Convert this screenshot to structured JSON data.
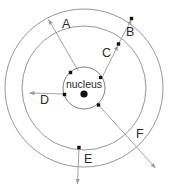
{
  "diagram": {
    "kind": "bohr-atomic-model",
    "background_color": "#ffffff",
    "orbit_stroke_color": "#8a8a8a",
    "arrow_stroke_color": "#9a9a9a",
    "electron_color": "#111111",
    "label_color": "#2b2b2b",
    "center": {
      "x": 84,
      "y": 88
    },
    "nucleus": {
      "label": "nucleus",
      "radius": 21,
      "core_dot_radius": 3.6
    },
    "orbits": [
      {
        "name": "nucleus-boundary",
        "radius": 21
      },
      {
        "name": "middle-shell",
        "radius": 62
      },
      {
        "name": "outer-shell",
        "radius": 79
      }
    ],
    "electrons": [
      {
        "name": "electron-nucleus-upper-left",
        "x": 70.5,
        "y": 72.5,
        "size": 3.4
      },
      {
        "name": "electron-nucleus-left",
        "x": 64.5,
        "y": 94.5,
        "size": 3.4
      },
      {
        "name": "electron-nucleus-upper-right",
        "x": 100.5,
        "y": 77.5,
        "size": 3.2
      },
      {
        "name": "electron-nucleus-lower-right",
        "x": 98.5,
        "y": 105.0,
        "size": 3.4
      },
      {
        "name": "electron-middle-upper-right",
        "x": 118.5,
        "y": 44.0,
        "size": 3.4
      },
      {
        "name": "electron-middle-bottom",
        "x": 79.0,
        "y": 147.5,
        "size": 3.4
      },
      {
        "name": "electron-outer-upper-right",
        "x": 131.5,
        "y": 18.5,
        "size": 3.4
      }
    ],
    "transitions": [
      {
        "id": "A",
        "label": "A",
        "label_x": 62,
        "label_y": 25,
        "from": {
          "x": 78.0,
          "y": 70.5
        },
        "to": {
          "x": 48.5,
          "y": 19.5
        },
        "head_angle_deg": 240
      },
      {
        "id": "B",
        "label": "B",
        "label_x": 126,
        "label_y": 33,
        "from": {
          "x": 118.5,
          "y": 44.0
        },
        "to": {
          "x": 131.5,
          "y": 19.5
        },
        "head_angle_deg": 298
      },
      {
        "id": "C",
        "label": "C",
        "label_x": 102,
        "label_y": 54,
        "from": {
          "x": 101.5,
          "y": 78.5
        },
        "to": {
          "x": 118.0,
          "y": 45.5
        },
        "head_angle_deg": 297
      },
      {
        "id": "D",
        "label": "D",
        "label_x": 40,
        "label_y": 101,
        "from": {
          "x": 64.5,
          "y": 94.0
        },
        "to": {
          "x": 29.5,
          "y": 93.0
        },
        "head_angle_deg": 182
      },
      {
        "id": "E",
        "label": "E",
        "label_x": 84,
        "label_y": 160,
        "from": {
          "x": 79.0,
          "y": 147.5
        },
        "to": {
          "x": 77.5,
          "y": 184.0
        },
        "head_angle_deg": 92
      },
      {
        "id": "F",
        "label": "F",
        "label_x": 136,
        "label_y": 135,
        "from": {
          "x": 98.5,
          "y": 105.0
        },
        "to": {
          "x": 155.5,
          "y": 168.0
        },
        "head_angle_deg": 48
      }
    ]
  }
}
